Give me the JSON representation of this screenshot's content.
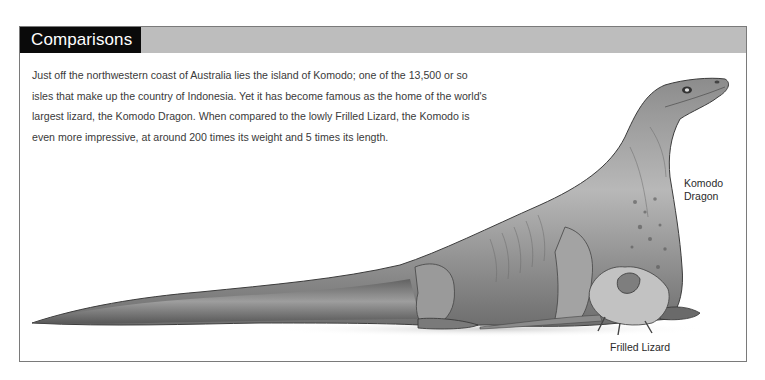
{
  "header": {
    "title": "Comparisons",
    "title_bg": "#0a0a0a",
    "bar_bg": "#bdbdbd"
  },
  "intro": {
    "lines": [
      "Just off the northwestern coast of Australia lies the island of Komodo; one of the 13,500 or so",
      "isles that make up the country of Indonesia. Yet it has become famous as the home of the world's",
      "largest lizard, the Komodo Dragon. When compared to the lowly Frilled Lizard, the Komodo is",
      "even more impressive, at around 200 times its weight and 5 times its length."
    ]
  },
  "illustration": {
    "subjects": [
      "Komodo Dragon",
      "Frilled Lizard"
    ]
  },
  "labels": {
    "komodo_line1": "Komodo",
    "komodo_line2": "Dragon",
    "frilled": "Frilled Lizard"
  }
}
